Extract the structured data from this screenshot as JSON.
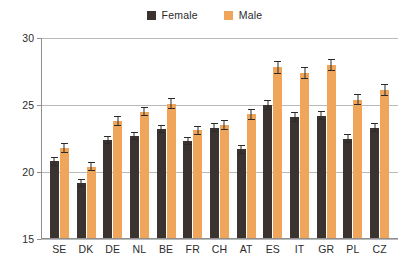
{
  "legend": {
    "position": "top-center",
    "entries": [
      {
        "label": "Female",
        "color": "#3a3330",
        "icon": "square-swatch-icon"
      },
      {
        "label": "Male",
        "color": "#f0a65a",
        "icon": "square-swatch-icon"
      }
    ]
  },
  "axis": {
    "y_tick_labels": [
      "30",
      "25",
      "20",
      "15"
    ],
    "x_tick_labels": [
      "SE",
      "DK",
      "DE",
      "NL",
      "BE",
      "FR",
      "CH",
      "AT",
      "ES",
      "IT",
      "GR",
      "PL",
      "CZ"
    ]
  },
  "chart_data": {
    "type": "bar",
    "title": "",
    "subtitle": "",
    "xlabel": "",
    "ylabel": "",
    "ylim": [
      15,
      30
    ],
    "yticks": [
      15,
      20,
      25,
      30
    ],
    "grid": true,
    "legend_position": "top-center",
    "error_bars": true,
    "categories": [
      "SE",
      "DK",
      "DE",
      "NL",
      "BE",
      "FR",
      "CH",
      "AT",
      "ES",
      "IT",
      "GR",
      "PL",
      "CZ"
    ],
    "series": [
      {
        "name": "Female",
        "color": "#3a3330",
        "values": [
          20.8,
          19.2,
          22.4,
          22.7,
          23.2,
          22.3,
          23.3,
          21.7,
          25.0,
          24.1,
          24.2,
          22.5,
          23.3
        ],
        "errors": [
          0.35,
          0.3,
          0.3,
          0.3,
          0.3,
          0.3,
          0.35,
          0.35,
          0.4,
          0.35,
          0.35,
          0.35,
          0.35
        ]
      },
      {
        "name": "Male",
        "color": "#f0a65a",
        "values": [
          21.8,
          20.4,
          23.8,
          24.5,
          25.1,
          23.1,
          23.5,
          24.3,
          27.8,
          27.4,
          28.0,
          25.4,
          26.1
        ],
        "errors": [
          0.4,
          0.35,
          0.35,
          0.35,
          0.4,
          0.35,
          0.4,
          0.4,
          0.45,
          0.45,
          0.45,
          0.4,
          0.45
        ]
      }
    ]
  }
}
